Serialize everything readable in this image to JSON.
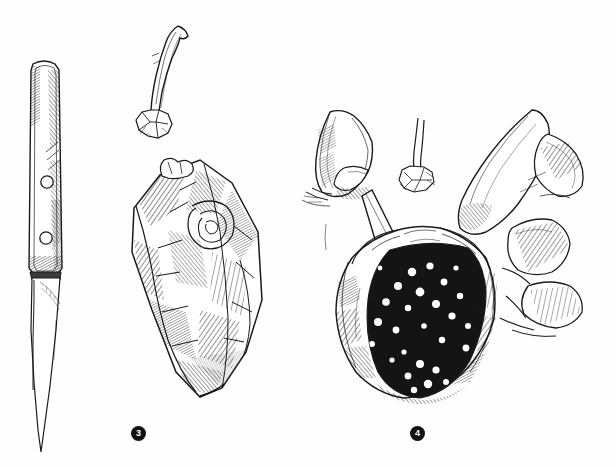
{
  "page": {
    "width": 616,
    "height": 467,
    "background_color": "#fefefe",
    "ink_color": "#1a1a1a",
    "type": "pen-and-ink line illustration"
  },
  "figure_markers": [
    {
      "id": "marker-3",
      "label": "3",
      "x": 138,
      "y": 433,
      "shape": "filled-circle",
      "fill": "#111111",
      "text_color": "#ffffff"
    },
    {
      "id": "marker-4",
      "label": "4",
      "x": 417,
      "y": 433,
      "shape": "filled-circle",
      "fill": "#111111",
      "text_color": "#ffffff"
    }
  ],
  "illustrations": [
    {
      "name": "paring-knife",
      "description": "Small paring knife drawn vertically, riveted handle at top with two round rivets, tapering blade pointing downward",
      "bbox": [
        20,
        60,
        64,
        455
      ],
      "parts": [
        "handle",
        "rivet-upper",
        "rivet-lower",
        "bolster",
        "blade",
        "blade-tip"
      ]
    },
    {
      "name": "detached-stem",
      "description": "Detached curved stem with a shriveled calyx crown at its base",
      "bbox": [
        138,
        22,
        196,
        140
      ]
    },
    {
      "name": "split-pod",
      "description": "Split fruit pod rendered with dense cross-hatching, interior visible, marked as step 3",
      "bbox": [
        118,
        155,
        272,
        400
      ],
      "marker": "3"
    },
    {
      "name": "hands-scraping-seeds",
      "description": "Two hands: left hand holds the knife blade angled into the pod, right hand holds the pod open; dark interior is speckled with pale seeds. Marked as step 4",
      "bbox": [
        310,
        100,
        595,
        400
      ],
      "marker": "4",
      "parts": [
        "left-hand-holding-knife",
        "knife-blade",
        "right-hand-holding-pod",
        "open-pod",
        "seeds",
        "small-detached-stem"
      ]
    }
  ]
}
